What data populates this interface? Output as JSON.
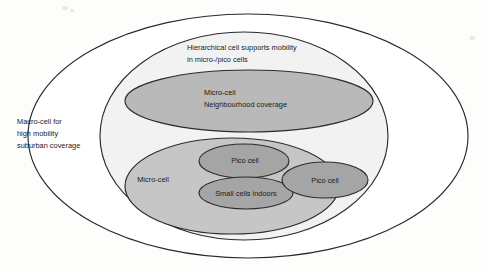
{
  "diagram": {
    "type": "nested-ellipse-venn",
    "background_color": "#fdfdfc",
    "stroke_color": "#2b2b2b",
    "layers": [
      {
        "name": "macro-cell",
        "fill_color": "#ffffff",
        "label_lines": [
          "Macro-cell for",
          "high mobility",
          "suburban coverage"
        ]
      },
      {
        "name": "hierarchical-cell",
        "fill_color": "#f2f2f2",
        "label_lines": [
          "Hierarchical cell supports mobility",
          "in micro-/pico cells"
        ]
      },
      {
        "name": "micro-cell-neighbourhood",
        "fill_color": "#b9b9b9",
        "label_lines": [
          "Micro-cell",
          "Neighbourhood coverage"
        ]
      },
      {
        "name": "micro-cell-lower",
        "fill_color": "#c6c6c6",
        "label_lines": [
          "Micro-cell"
        ]
      },
      {
        "name": "pico-cell-upper",
        "fill_color": "#a5a5a5",
        "label_lines": [
          "Pico cell"
        ]
      },
      {
        "name": "pico-cell-right",
        "fill_color": "#a5a5a5",
        "label_lines": [
          "Pico cell"
        ]
      },
      {
        "name": "small-cells-indoors",
        "fill_color": "#a5a5a5",
        "label_lines": [
          "Small cells indoors"
        ]
      }
    ]
  },
  "labels": {
    "macro_line1": "Macro-cell for",
    "macro_line2": "high mobility",
    "macro_line3": "suburban coverage",
    "hierarchical_line1": "Hierarchical cell supports mobility",
    "hierarchical_line2": "in micro-/pico cells",
    "micro_neighbourhood_line1": "Micro-cell",
    "micro_neighbourhood_line2": "Neighbourhood coverage",
    "micro_cell_lower": "Micro-cell",
    "pico_cell_upper": "Pico cell",
    "pico_cell_right": "Pico cell",
    "small_cells_indoors": "Small cells indoors"
  }
}
